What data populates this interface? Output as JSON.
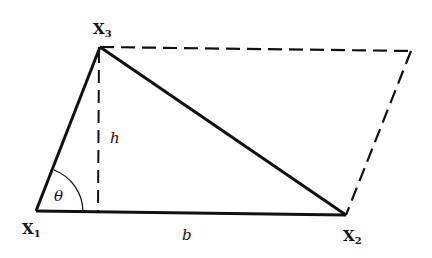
{
  "diagram": {
    "type": "parallelogram-triangle-area",
    "colors": {
      "stroke": "#111111",
      "background": "#ffffff"
    },
    "vertices": {
      "X1": {
        "label": "X",
        "subscript": "1",
        "x": 36,
        "y": 211
      },
      "X2": {
        "label": "X",
        "subscript": "2",
        "x": 346,
        "y": 215
      },
      "X3": {
        "label": "X",
        "subscript": "3",
        "x": 100,
        "y": 47
      },
      "X4": {
        "x": 411,
        "y": 51
      }
    },
    "foot": {
      "x": 98,
      "y": 212
    },
    "labels": {
      "height": "h",
      "base": "b",
      "angle": "θ"
    },
    "solid_edges": [
      "X1-X2",
      "X1-X3",
      "X3-X2"
    ],
    "dashed_edges": [
      "X3-X4",
      "X4-X2",
      "X3-foot"
    ]
  }
}
